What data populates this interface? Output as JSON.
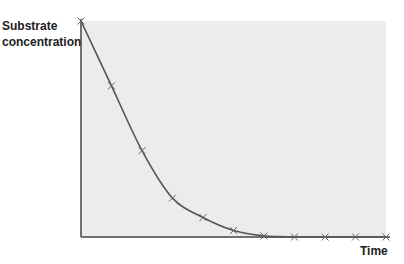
{
  "chart_data": {
    "type": "line",
    "title": "",
    "xlabel": "Time",
    "ylabel": "Substrate concentration",
    "ylabel_lines": [
      "Substrate",
      "concentration"
    ],
    "x": [
      0,
      1,
      2,
      3,
      4,
      5,
      6,
      7,
      8,
      9,
      10
    ],
    "series": [
      {
        "name": "Substrate concentration",
        "values": [
          100,
          70,
          40,
          18,
          9,
          3,
          0.5,
          0,
          0,
          0,
          0
        ],
        "marker": "x"
      }
    ],
    "xlim": [
      0,
      10
    ],
    "ylim": [
      0,
      100
    ],
    "ticks": "none",
    "grid": false,
    "legend": "none",
    "colors": {
      "plot_background": "#ececec",
      "line": "#555555",
      "marker": "#666666",
      "axis": "#444444"
    }
  }
}
